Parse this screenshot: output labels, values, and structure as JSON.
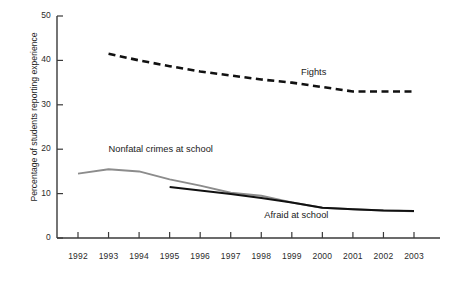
{
  "chart_data": {
    "type": "line",
    "title": "",
    "xlabel": "",
    "ylabel": "Percentage of students reporting experience",
    "x": [
      1992,
      1993,
      1994,
      1995,
      1996,
      1997,
      1998,
      1999,
      2000,
      2001,
      2002,
      2003
    ],
    "xtick_labels": [
      "1992",
      "1993",
      "1994",
      "1995",
      "1996",
      "1997",
      "1998",
      "1999",
      "2000",
      "2001",
      "2002",
      "2003"
    ],
    "ytick_labels": [
      "0",
      "10",
      "20",
      "30",
      "40",
      "50"
    ],
    "yticks": [
      0,
      10,
      20,
      30,
      40,
      50
    ],
    "ylim": [
      0,
      50
    ],
    "xlim": [
      1992,
      2003
    ],
    "grid": false,
    "legend_position": "inline-annotations",
    "series": [
      {
        "name": "Fights",
        "style": "dashed",
        "color": "#111111",
        "x": [
          1993,
          1994,
          1995,
          1996,
          1997,
          1998,
          1999,
          2000,
          2001,
          2002,
          2003
        ],
        "values": [
          41.5,
          40.0,
          38.7,
          37.5,
          36.6,
          35.7,
          35.0,
          34.0,
          33.0,
          33.0,
          33.0
        ]
      },
      {
        "name": "Nonfatal crimes at school",
        "style": "solid",
        "color": "#8c8c8c",
        "x": [
          1992,
          1993,
          1994,
          1995,
          1996,
          1997,
          1998,
          1999,
          2000,
          2001,
          2002,
          2003
        ],
        "values": [
          14.5,
          15.5,
          15.0,
          13.2,
          11.8,
          10.2,
          9.5,
          8.0,
          6.8,
          6.5,
          6.2,
          6.0
        ]
      },
      {
        "name": "Afraid at school",
        "style": "solid",
        "color": "#111111",
        "x": [
          1995,
          1996,
          1997,
          1998,
          1999,
          2000,
          2001,
          2002,
          2003
        ],
        "values": [
          11.5,
          10.7,
          9.9,
          9.0,
          8.0,
          6.8,
          6.5,
          6.2,
          6.1
        ]
      }
    ],
    "annotations": [
      {
        "text": "Fights",
        "x": 1999.3,
        "y": 37.0
      },
      {
        "text": "Nonfatal crimes at school",
        "x": 1993.0,
        "y": 19.6
      },
      {
        "text": "Afraid at school",
        "x": 1998.1,
        "y": 4.8
      }
    ]
  }
}
